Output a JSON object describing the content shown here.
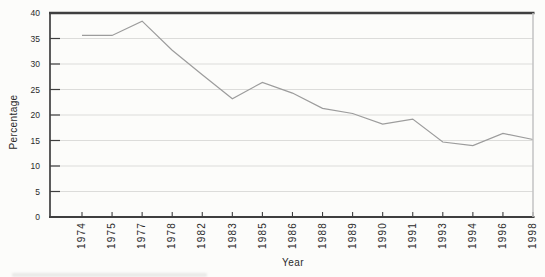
{
  "figure": {
    "background": "#fcfcfa"
  },
  "chart_data": {
    "type": "line",
    "xlabel": "Year",
    "ylabel": "Percentage",
    "categories": [
      "1974",
      "1975",
      "1977",
      "1978",
      "1982",
      "1983",
      "1985",
      "1986",
      "1988",
      "1989",
      "1990",
      "1991",
      "1993",
      "1994",
      "1996",
      "1998"
    ],
    "values": [
      35.6,
      35.6,
      38.4,
      32.7,
      27.9,
      23.2,
      26.4,
      24.3,
      21.3,
      20.3,
      18.2,
      19.2,
      14.7,
      14.0,
      16.4,
      15.2
    ],
    "ylim": [
      0,
      40
    ],
    "yticks": [
      0,
      5,
      10,
      15,
      20,
      25,
      30,
      35,
      40
    ],
    "grid": true,
    "legend": "none",
    "colors": {
      "line": "#9c9c9c",
      "frame": "#3f3f3f",
      "right_border": "#c3c3c3",
      "gridline": "#dcdcda",
      "text": "#2a2a2a"
    }
  }
}
